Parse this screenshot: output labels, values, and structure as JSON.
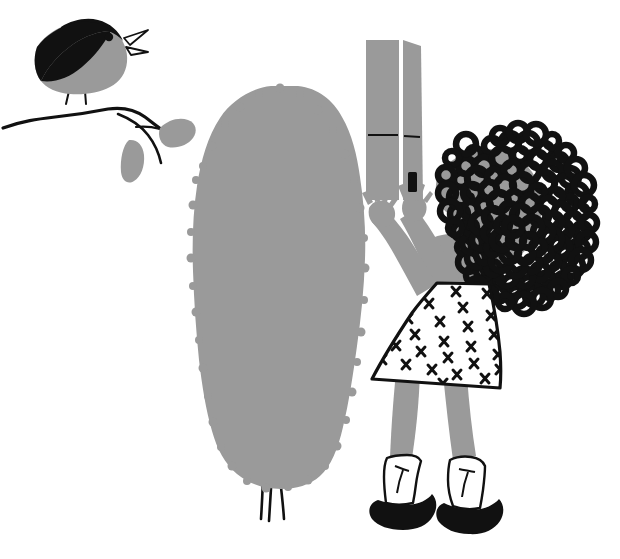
{
  "illustration": {
    "title": "Girl reaching up holding a carton beside a bush, with a singing bird on a branch",
    "style": "flat two-tone children's book illustration",
    "canvas": {
      "width": 620,
      "height": 559
    },
    "palette": {
      "background": "#ffffff",
      "grey": "#9a9a9a",
      "grey_light": "#a6a6a6",
      "ink": "#111111",
      "white": "#ffffff"
    },
    "scene_elements": [
      {
        "name": "bird",
        "label": "Singing bird",
        "color": "#9a9a9a",
        "accent": "#111111"
      },
      {
        "name": "branch",
        "label": "Branch with two leaves",
        "color": "#111111",
        "leaf_color": "#9a9a9a"
      },
      {
        "name": "bush",
        "label": "Tall grey bush",
        "color": "#9a9a9a",
        "trunk_color": "#111111"
      },
      {
        "name": "carton",
        "label": "Grey carton held overhead",
        "color": "#9a9a9a",
        "latch_color": "#111111"
      },
      {
        "name": "girl",
        "label": "Girl with curly hair",
        "skin": "#9a9a9a",
        "hair": "#111111",
        "dress": "#ffffff"
      },
      {
        "name": "dress",
        "label": "White dress with X print",
        "print_mark": "x",
        "print_count": 26
      },
      {
        "name": "socks",
        "label": "White ankle socks",
        "color": "#ffffff"
      },
      {
        "name": "shoes",
        "label": "Black shoes",
        "color": "#111111"
      }
    ],
    "bird": {
      "label": "Bird",
      "parts": [
        "head",
        "body",
        "wing",
        "beak",
        "eye",
        "tail",
        "legs"
      ],
      "beak_state": "open",
      "facing": "right"
    },
    "branch": {
      "label": "Branch",
      "leaf_count": 2
    },
    "bush": {
      "label": "Bush",
      "trunk_line_count": 3
    },
    "carton": {
      "label": "Carton",
      "panel_count": 2,
      "has_latch": true,
      "has_seam_line": true
    },
    "girl": {
      "label": "Girl",
      "pose": "both arms raised overhead",
      "hand_count": 2,
      "finger_count_per_hand": 4,
      "hair_style": "curly afro",
      "hair_curl_count": 120
    }
  }
}
